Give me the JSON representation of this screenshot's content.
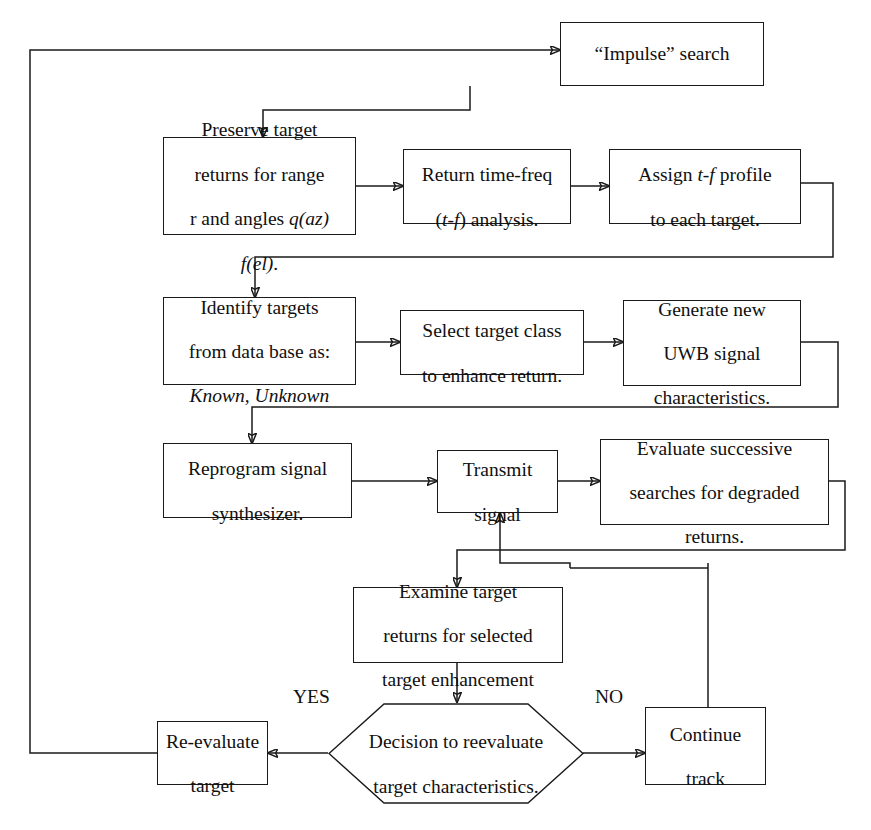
{
  "diagram": {
    "background": "#ffffff",
    "line_color": "#1a1a1a",
    "text_color": "#101010"
  },
  "nodes": {
    "impulse_search": {
      "label": "“Impulse” search"
    },
    "preserve_target": {
      "line1": "Preserve target",
      "line2": "returns for range",
      "line3_pre": "r and angles ",
      "line3_em": "q(az)",
      "line4_em": "f(el)",
      "line4_post": "."
    },
    "return_time_freq": {
      "line1": "Return time-freq",
      "line2_pre": "(",
      "line2_em": "t-f",
      "line2_post": ") analysis."
    },
    "assign_tf_profile": {
      "line1_pre": "Assign ",
      "line1_em": "t-f",
      "line1_post": " profile",
      "line2": "to each target."
    },
    "identify_targets": {
      "line1": "Identify targets",
      "line2": "from data base as:",
      "line3_em": "Known, Unknown"
    },
    "select_target_class": {
      "line1": "Select target class",
      "line2": "to enhance return."
    },
    "generate_uwb": {
      "line1": "Generate new",
      "line2": "UWB signal",
      "line3": "characteristics."
    },
    "reprogram_synth": {
      "line1": "Reprogram signal",
      "line2": "synthesizer."
    },
    "transmit_signal": {
      "line1": "Transmit",
      "line2": "signal"
    },
    "evaluate_searches": {
      "line1": "Evaluate successive",
      "line2": "searches for degraded",
      "line3": "returns."
    },
    "examine_target": {
      "line1": "Examine target",
      "line2": "returns for selected",
      "line3": "target enhancement"
    },
    "decision": {
      "line1": "Decision to reevaluate",
      "line2": "target characteristics."
    },
    "reevaluate_target": {
      "line1": "Re-evaluate",
      "line2": "target"
    },
    "continue_track": {
      "line1": "Continue",
      "line2": "track"
    }
  },
  "edge_labels": {
    "yes": "YES",
    "no": "NO"
  }
}
